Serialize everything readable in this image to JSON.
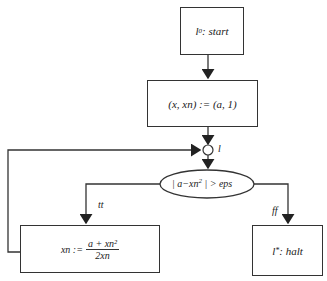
{
  "diagram": {
    "type": "flowchart",
    "nodes": {
      "start": {
        "label_main": "l",
        "label_sub": "0",
        "label_rest": ": start"
      },
      "init": {
        "label": "(x, xn) := (a, 1)"
      },
      "join": {
        "label": "l"
      },
      "cond": {
        "label_left": "| a−xn",
        "label_sup": "2",
        "label_right": " | > eps"
      },
      "update": {
        "lhs": "xn :=",
        "num": "a + xn²",
        "den": "2xn"
      },
      "halt": {
        "label_main": "l",
        "label_sub": "*",
        "label_rest": ": halt"
      }
    },
    "edges": {
      "true_label": "tt",
      "false_label": "ff"
    },
    "colors": {
      "stroke": "#333333",
      "background": "#ffffff"
    }
  }
}
